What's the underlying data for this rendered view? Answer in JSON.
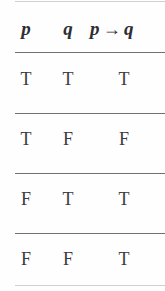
{
  "figure": {
    "name": "truth-table",
    "caption": "",
    "text_color": "#2e2e33",
    "rule_color": "#6e7076",
    "faint_rule_color": "#cfd0d3",
    "background": "#fefefe"
  },
  "table": {
    "headers": [
      {
        "id": "p",
        "label": "p"
      },
      {
        "id": "q",
        "label": "q"
      },
      {
        "id": "pq",
        "left": "p",
        "operator": "→",
        "right": "q",
        "label": "p → q"
      }
    ],
    "rows": [
      {
        "p": "T",
        "q": "T",
        "pq": "T"
      },
      {
        "p": "T",
        "q": "F",
        "pq": "F"
      },
      {
        "p": "F",
        "q": "T",
        "pq": "T"
      },
      {
        "p": "F",
        "q": "F",
        "pq": "T"
      }
    ]
  },
  "chart_data": {
    "type": "table",
    "title": "",
    "columns": [
      "p",
      "q",
      "p → q"
    ],
    "values": [
      [
        "T",
        "T",
        "T"
      ],
      [
        "T",
        "F",
        "F"
      ],
      [
        "F",
        "T",
        "T"
      ],
      [
        "F",
        "F",
        "T"
      ]
    ]
  }
}
